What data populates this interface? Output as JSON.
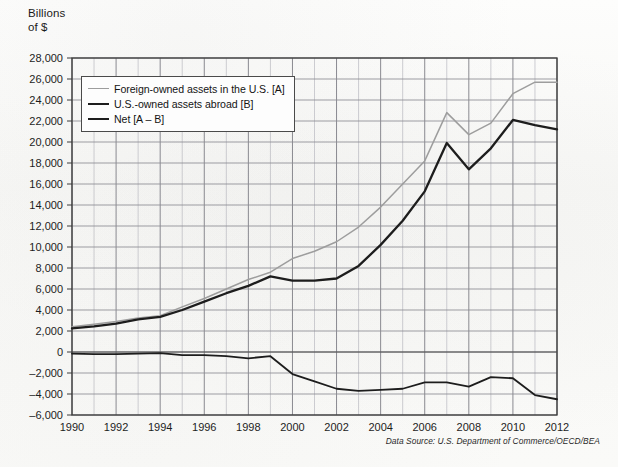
{
  "axis_title": "Billions\nof $",
  "source_note": "Data Source: U.S. Department of Commerce/OECD/BEA",
  "legend": {
    "items": [
      {
        "label": "Foreign-owned assets in the U.S. [A]",
        "key": "A",
        "color": "#9d9d9d"
      },
      {
        "label": "U.S.-owned assets abroad [B]",
        "key": "B",
        "color": "#1d1d1d"
      },
      {
        "label": "Net [A – B]",
        "key": "A-B",
        "color": "#1d1d1d"
      }
    ]
  },
  "end_labels": [
    {
      "text": "A",
      "series": "A"
    },
    {
      "text": "B",
      "series": "B"
    },
    {
      "text": "A – B",
      "series": "A-B"
    }
  ],
  "chart_data": {
    "type": "line",
    "title": "",
    "subtitle": "",
    "xlabel": "",
    "ylabel": "Billions of $",
    "xlim": [
      1990,
      2012
    ],
    "ylim": [
      -6000,
      28000
    ],
    "ytick_step": 2000,
    "xtick_step": 2,
    "grid": true,
    "grid_minor_x_step": 1,
    "legend_position": "upper-left-inside",
    "ytick_labels": [
      "28,000",
      "26,000",
      "24,000",
      "22,000",
      "20,000",
      "18,000",
      "16,000",
      "14,000",
      "12,000",
      "10,000",
      "8,000",
      "6,000",
      "4,000",
      "2,000",
      "0",
      "–2,000",
      "–4,000",
      "–6,000"
    ],
    "ytick_values": [
      28000,
      26000,
      24000,
      22000,
      20000,
      18000,
      16000,
      14000,
      12000,
      10000,
      8000,
      6000,
      4000,
      2000,
      0,
      -2000,
      -4000,
      -6000
    ],
    "xtick_labels": [
      "1990",
      "1992",
      "1994",
      "1996",
      "1998",
      "2000",
      "2002",
      "2004",
      "2006",
      "2008",
      "2010",
      "2012"
    ],
    "xtick_values": [
      1990,
      1992,
      1994,
      1996,
      1998,
      2000,
      2002,
      2004,
      2006,
      2008,
      2010,
      2012
    ],
    "x": [
      1990,
      1991,
      1992,
      1993,
      1994,
      1995,
      1996,
      1997,
      1998,
      1999,
      2000,
      2001,
      2002,
      2003,
      2004,
      2005,
      2006,
      2007,
      2008,
      2009,
      2010,
      2011,
      2012
    ],
    "series": [
      {
        "name": "Foreign-owned assets in the U.S. [A]",
        "key": "A",
        "color": "#9d9d9d",
        "values": [
          2400,
          2650,
          2900,
          3250,
          3450,
          4300,
          5100,
          6000,
          6900,
          7600,
          8900,
          9600,
          10500,
          11900,
          13800,
          16000,
          18200,
          22800,
          20700,
          21800,
          24600,
          25700,
          25700
        ]
      },
      {
        "name": "U.S.-owned assets abroad [B]",
        "key": "B",
        "color": "#1d1d1d",
        "values": [
          2250,
          2450,
          2700,
          3100,
          3350,
          4000,
          4800,
          5600,
          6300,
          7200,
          6800,
          6800,
          7000,
          8200,
          10200,
          12500,
          15300,
          19900,
          17400,
          19400,
          22100,
          21600,
          21200
        ]
      },
      {
        "name": "Net [A – B]",
        "key": "A-B",
        "color": "#1d1d1d",
        "values": [
          -150,
          -200,
          -200,
          -150,
          -100,
          -300,
          -300,
          -400,
          -600,
          -400,
          -2100,
          -2800,
          -3500,
          -3700,
          -3600,
          -3500,
          -2900,
          -2900,
          -3300,
          -2400,
          -2500,
          -4100,
          -4500
        ]
      }
    ]
  }
}
